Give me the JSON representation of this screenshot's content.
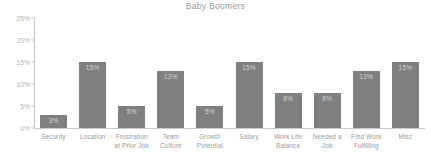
{
  "chart_data": {
    "type": "bar",
    "title": "Baby Boomers",
    "xlabel": "",
    "ylabel": "",
    "ylim": [
      0,
      25
    ],
    "ytick_labels": [
      "25%",
      "20%",
      "15%",
      "10%",
      "5%",
      "0%"
    ],
    "yticks": [
      25,
      20,
      15,
      10,
      5,
      0
    ],
    "grid": false,
    "legend": "none",
    "categories": [
      "Security",
      "Location",
      "Frustration at Prior Job",
      "Team Culture",
      "Growth Potential",
      "Salary",
      "Work Life Balance",
      "Needed a Job",
      "Find Work Fulfilling",
      "Misc"
    ],
    "category_lines": [
      [
        "Security"
      ],
      [
        "Location"
      ],
      [
        "Frustration",
        "at Prior Job"
      ],
      [
        "Team",
        "Culture"
      ],
      [
        "Growth",
        "Potential"
      ],
      [
        "Salary"
      ],
      [
        "Work Life",
        "Balance"
      ],
      [
        "Needed a",
        "Job"
      ],
      [
        "Find Work",
        "Fulfilling"
      ],
      [
        "Misc"
      ]
    ],
    "values": [
      3,
      15,
      5,
      13,
      5,
      15,
      8,
      8,
      13,
      15
    ],
    "data_labels": [
      "3%",
      "15%",
      "5%",
      "13%",
      "5%",
      "15%",
      "8%",
      "8%",
      "13%",
      "15%"
    ],
    "bar_color": "#808080",
    "data_label_color": "#d8d8d8",
    "axis_color": "#c9c9c9",
    "tick_label_color": "#b0b0b0",
    "title_color": "#9a9a9a",
    "category_label_color": "#9a9a9a",
    "background_color": "#ffffff"
  }
}
